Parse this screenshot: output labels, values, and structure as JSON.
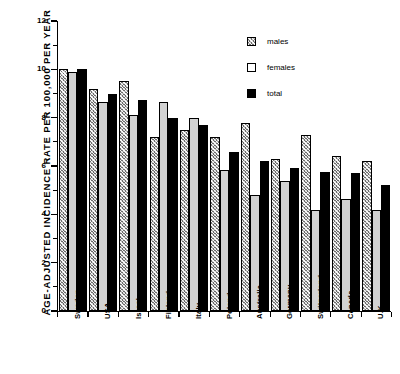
{
  "chart_data": {
    "type": "bar",
    "title": "",
    "subtitle": "",
    "xlabel": "",
    "ylabel": "AGE-ADJUSTED INCIDENCE RATE PER 100,000 PER YEAR",
    "ylim": [
      0,
      12
    ],
    "yticks": [
      0,
      2,
      4,
      6,
      8,
      10,
      12
    ],
    "ytick_labels": [
      "0",
      "2",
      "4",
      "6",
      "8",
      "10",
      "12"
    ],
    "yminor_ticks": [
      1,
      3,
      5,
      7,
      9,
      11
    ],
    "grid": false,
    "legend_position": "top-right",
    "categories": [
      "Sweden",
      "USA",
      "Israel",
      "Finland",
      "Italy",
      "Poland",
      "Australia",
      "Germany",
      "Switzerland",
      "Canada",
      "U.K."
    ],
    "series": [
      {
        "name": "males",
        "color": "#6e6e6e",
        "pattern": "cross-hatch",
        "values": [
          10.0,
          9.2,
          9.5,
          7.2,
          7.5,
          7.2,
          7.8,
          6.3,
          7.3,
          6.4,
          6.2
        ]
      },
      {
        "name": "females",
        "color": "#d2d2d2",
        "pattern": "solid-light",
        "values": [
          9.9,
          8.65,
          8.1,
          8.65,
          8.0,
          5.85,
          4.8,
          5.4,
          4.2,
          4.65,
          4.2
        ]
      },
      {
        "name": "total",
        "color": "#000000",
        "pattern": "solid-black",
        "values": [
          10.0,
          9.0,
          8.75,
          8.0,
          7.7,
          6.6,
          6.2,
          5.9,
          5.75,
          5.7,
          5.2
        ]
      }
    ]
  },
  "legend": {
    "entries": [
      {
        "label": "males"
      },
      {
        "label": "females"
      },
      {
        "label": "total"
      }
    ]
  }
}
